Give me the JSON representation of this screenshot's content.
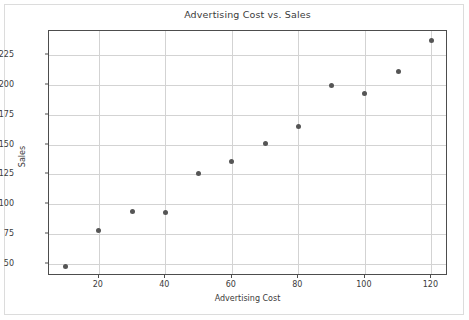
{
  "chart_data": {
    "type": "scatter",
    "title": "Advertising Cost vs. Sales",
    "xlabel": "Advertising Cost",
    "ylabel": "Sales",
    "x": [
      10,
      20,
      30,
      40,
      50,
      60,
      70,
      80,
      90,
      100,
      110,
      120
    ],
    "values": [
      48,
      78,
      94,
      93,
      126,
      136,
      151,
      165,
      199,
      193,
      211,
      237
    ],
    "xlim": [
      5,
      125
    ],
    "ylim": [
      40,
      245
    ],
    "xticks": [
      20,
      40,
      60,
      80,
      100,
      120
    ],
    "xtick_labels": [
      "20",
      "40",
      "60",
      "80",
      "100",
      "120"
    ],
    "yticks": [
      50,
      75,
      100,
      125,
      150,
      175,
      200,
      225
    ],
    "ytick_labels": [
      "50",
      "75",
      "100",
      "125",
      "150",
      "175",
      "200",
      "225"
    ],
    "grid": true,
    "legend": null,
    "marker_color": "#555555",
    "grid_color": "#d3d3d3",
    "axis_color": "#4d4d4d",
    "background": "#ffffff"
  }
}
